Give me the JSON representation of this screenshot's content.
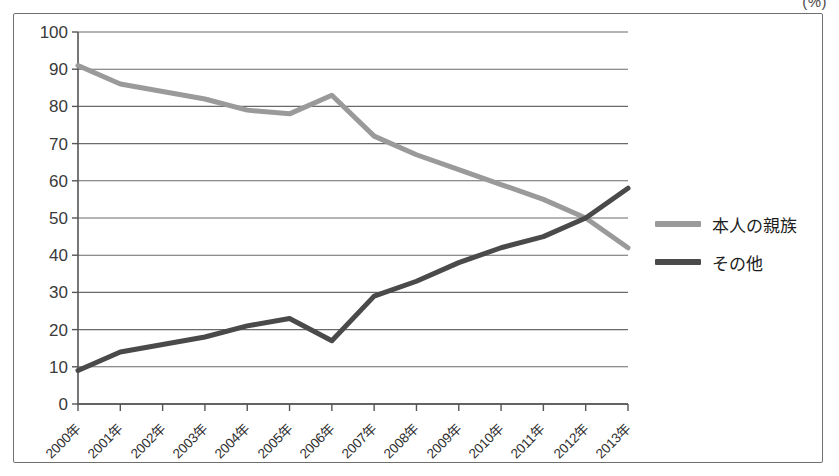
{
  "unit_label": "(%)",
  "legend": {
    "items": [
      {
        "label": "本人の親族",
        "color": "#9a9a9a",
        "swatch_name": "legend-swatch-honnin"
      },
      {
        "label": "その他",
        "color": "#4a4a4a",
        "swatch_name": "legend-swatch-sonota"
      }
    ]
  },
  "chart_data": {
    "type": "line",
    "title": "",
    "subtitle": "",
    "xlabel": "",
    "ylabel": "",
    "unit": "(%)",
    "grid": true,
    "legend_position": "right",
    "ylim": [
      0,
      100
    ],
    "yticks": [
      0,
      10,
      20,
      30,
      40,
      50,
      60,
      70,
      80,
      90,
      100
    ],
    "ytick_labels": [
      "0",
      "10",
      "20",
      "30",
      "40",
      "50",
      "60",
      "70",
      "80",
      "90",
      "100"
    ],
    "categories": [
      "2000年",
      "2001年",
      "2002年",
      "2003年",
      "2004年",
      "2005年",
      "2006年",
      "2007年",
      "2008年",
      "2009年",
      "2010年",
      "2011年",
      "2012年",
      "2013年"
    ],
    "series": [
      {
        "name": "本人の親族",
        "color": "#9a9a9a",
        "values": [
          91,
          86,
          84,
          82,
          79,
          78,
          83,
          72,
          67,
          63,
          59,
          55,
          50,
          42
        ]
      },
      {
        "name": "その他",
        "color": "#4a4a4a",
        "values": [
          9,
          14,
          16,
          18,
          21,
          23,
          17,
          29,
          33,
          38,
          42,
          45,
          50,
          58
        ]
      }
    ]
  },
  "colors": {
    "frame": "#6f6f6f",
    "axis": "#555555",
    "gridline": "#6a6a6a",
    "background": "#ffffff",
    "series_light": "#9a9a9a",
    "series_dark": "#4a4a4a"
  }
}
